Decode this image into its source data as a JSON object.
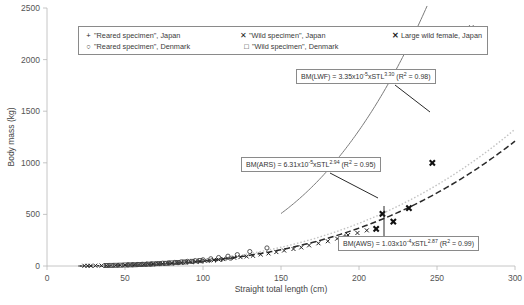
{
  "chart_data": {
    "type": "scatter",
    "title": "",
    "xlabel": "Straight total length (cm)",
    "ylabel": "Body mass (kg)",
    "xlim": [
      0,
      300
    ],
    "ylim": [
      0,
      2500
    ],
    "xticks": [
      0,
      50,
      100,
      150,
      200,
      250,
      300
    ],
    "yticks": [
      0,
      500,
      1000,
      1500,
      2000,
      2500
    ],
    "grid": false,
    "legend_position": "top-left-inside",
    "legend": [
      {
        "label": "\"Reared specimen\", Japan",
        "marker": "plus",
        "color": "#3a3a3a"
      },
      {
        "label": "\"Wild specimen\", Japan",
        "marker": "x-small",
        "color": "#222222"
      },
      {
        "label": "Large wild female, Japan",
        "marker": "x-bold",
        "color": "#111111"
      },
      {
        "label": "\"Reared specimen\", Denmark",
        "marker": "circle-open",
        "color": "#444444"
      },
      {
        "label": "\"Wild specimen\", Denmark",
        "marker": "square-open",
        "color": "#444444"
      }
    ],
    "annotations": [
      {
        "id": "eq-lwf",
        "prefix": "BM(LWF)  =  3.35x10",
        "exp1": "-5",
        "mid": "xSTL",
        "exp2": "3.30",
        "suffix_pre": "  (R",
        "suffix_exp": "2",
        "suffix_post": " = 0.98)",
        "curve": "LWF"
      },
      {
        "id": "eq-ars",
        "prefix": "BM(ARS)  =  6.31x10",
        "exp1": "-5",
        "mid": "xSTL",
        "exp2": "2.94",
        "suffix_pre": "  (R",
        "suffix_exp": "2",
        "suffix_post": " = 0.95)",
        "curve": "ARS"
      },
      {
        "id": "eq-aws",
        "prefix": "BM(AWS)  =  1.03x10",
        "exp1": "-4",
        "mid": "xSTL",
        "exp2": "2.87",
        "suffix_pre": "  (R",
        "suffix_exp": "2",
        "suffix_post": " = 0.99)",
        "curve": "AWS"
      }
    ],
    "curves": [
      {
        "name": "LWF",
        "style": "solid",
        "color": "#7a7a7a",
        "coefficient": 3.35e-05,
        "exponent": 3.3,
        "r2": 0.98,
        "x_start": 150,
        "x_end": 288
      },
      {
        "name": "ARS",
        "style": "dashed",
        "color": "#2a2a2a",
        "coefficient": 6.31e-05,
        "exponent": 2.94,
        "r2": 0.95,
        "x_start": 20,
        "x_end": 300
      },
      {
        "name": "AWS",
        "style": "dotted",
        "color": "#c2c2c2",
        "coefficient": 0.000103,
        "exponent": 2.87,
        "r2": 0.99,
        "x_start": 20,
        "x_end": 300
      }
    ],
    "series": [
      {
        "name": "Large wild female, Japan",
        "marker": "x-bold",
        "color": "#111111",
        "points": [
          [
            272,
            2300
          ],
          [
            247,
            1000
          ],
          [
            232,
            560
          ],
          [
            222,
            430
          ],
          [
            215,
            505
          ],
          [
            211,
            360
          ]
        ]
      },
      {
        "name": "\"Reared specimen\", Japan",
        "marker": "plus",
        "color": "#3a3a3a",
        "points": [
          [
            191,
            290
          ],
          [
            118,
            72
          ],
          [
            112,
            60
          ],
          [
            108,
            54
          ],
          [
            104,
            50
          ],
          [
            100,
            44
          ],
          [
            97,
            40
          ],
          [
            94,
            38
          ],
          [
            90,
            34
          ],
          [
            87,
            31
          ],
          [
            84,
            29
          ],
          [
            81,
            26
          ],
          [
            78,
            24
          ],
          [
            75,
            22
          ],
          [
            72,
            20
          ],
          [
            69,
            18
          ],
          [
            66,
            16
          ]
        ]
      },
      {
        "name": "\"Wild specimen\", Japan",
        "marker": "x-small",
        "color": "#222222",
        "points": [
          [
            205,
            345
          ],
          [
            199,
            320
          ],
          [
            193,
            300
          ],
          [
            186,
            265
          ],
          [
            180,
            240
          ],
          [
            174,
            220
          ],
          [
            168,
            200
          ],
          [
            163,
            180
          ],
          [
            158,
            165
          ],
          [
            152,
            150
          ],
          [
            147,
            135
          ],
          [
            142,
            122
          ],
          [
            137,
            112
          ],
          [
            132,
            100
          ],
          [
            128,
            92
          ],
          [
            124,
            86
          ],
          [
            120,
            80
          ],
          [
            116,
            72
          ],
          [
            113,
            67
          ],
          [
            110,
            62
          ],
          [
            107,
            58
          ],
          [
            104,
            54
          ],
          [
            101,
            50
          ],
          [
            98,
            46
          ],
          [
            95,
            43
          ],
          [
            92,
            40
          ],
          [
            89,
            37
          ],
          [
            86,
            34
          ],
          [
            83,
            31
          ],
          [
            80,
            28
          ],
          [
            77,
            26
          ],
          [
            74,
            24
          ],
          [
            71,
            21
          ],
          [
            68,
            19
          ],
          [
            65,
            17
          ],
          [
            62,
            15
          ],
          [
            59,
            13
          ],
          [
            56,
            12
          ],
          [
            53,
            10
          ],
          [
            50,
            9
          ],
          [
            47,
            8
          ],
          [
            44,
            7
          ],
          [
            41,
            6
          ],
          [
            38,
            5
          ],
          [
            35,
            4
          ],
          [
            31,
            3
          ],
          [
            28,
            2
          ],
          [
            26,
            2
          ],
          [
            24,
            2
          ]
        ]
      },
      {
        "name": "\"Reared specimen\", Denmark",
        "marker": "circle-open",
        "color": "#444444",
        "points": [
          [
            141,
            175
          ],
          [
            130,
            140
          ],
          [
            122,
            110
          ],
          [
            116,
            95
          ],
          [
            110,
            82
          ],
          [
            105,
            70
          ],
          [
            100,
            60
          ],
          [
            95,
            52
          ],
          [
            90,
            45
          ],
          [
            86,
            40
          ],
          [
            82,
            35
          ],
          [
            78,
            31
          ],
          [
            74,
            27
          ],
          [
            70,
            23
          ],
          [
            67,
            20
          ],
          [
            64,
            18
          ],
          [
            61,
            16
          ],
          [
            58,
            14
          ],
          [
            55,
            12
          ],
          [
            52,
            11
          ]
        ]
      },
      {
        "name": "\"Wild specimen\", Denmark",
        "marker": "square-open",
        "color": "#444444",
        "points": [
          [
            98,
            52
          ],
          [
            93,
            45
          ],
          [
            88,
            39
          ],
          [
            84,
            34
          ],
          [
            80,
            30
          ],
          [
            76,
            26
          ],
          [
            72,
            23
          ],
          [
            68,
            20
          ],
          [
            65,
            18
          ],
          [
            62,
            16
          ],
          [
            59,
            14
          ],
          [
            56,
            12
          ],
          [
            53,
            11
          ],
          [
            50,
            10
          ],
          [
            47,
            8
          ],
          [
            44,
            7
          ],
          [
            41,
            6
          ],
          [
            38,
            5
          ]
        ]
      }
    ]
  },
  "caption": {
    "text": ""
  }
}
